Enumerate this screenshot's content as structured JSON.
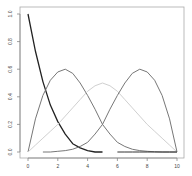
{
  "chart_data": {
    "type": "line",
    "title": "",
    "xlabel": "",
    "ylabel": "",
    "xlim": [
      0,
      10
    ],
    "ylim": [
      0,
      1
    ],
    "grid": false,
    "legend": null,
    "x_ticks": [
      "0",
      "2",
      "4",
      "6",
      "8",
      "10"
    ],
    "y_ticks": [
      "0.0",
      "0.2",
      "0.4",
      "0.6",
      "0.8",
      "1.0"
    ],
    "x": [
      0,
      0.5,
      1,
      1.5,
      2,
      2.5,
      3,
      3.5,
      4,
      4.5,
      5,
      5.5,
      6,
      6.5,
      7,
      7.5,
      8,
      8.5,
      9,
      9.5,
      10
    ],
    "series": [
      {
        "name": "basis-1",
        "color": "#222222",
        "values": [
          1.0,
          0.73,
          0.51,
          0.34,
          0.22,
          0.13,
          0.06,
          0.03,
          0.01,
          0.0,
          0.0,
          null,
          null,
          null,
          null,
          null,
          null,
          null,
          null,
          null,
          null
        ]
      },
      {
        "name": "basis-2",
        "color": "#777777",
        "values": [
          0.0,
          0.24,
          0.41,
          0.52,
          0.58,
          0.6,
          0.57,
          0.5,
          0.41,
          0.31,
          0.2,
          0.13,
          0.07,
          0.04,
          0.02,
          0.01,
          0.005,
          0.002,
          0.0,
          0.0,
          0.0
        ]
      },
      {
        "name": "basis-3",
        "color": "#d0d0d0",
        "values": [
          0.0,
          0.05,
          0.1,
          0.15,
          0.2,
          0.26,
          0.32,
          0.38,
          0.44,
          0.48,
          0.5,
          0.48,
          0.44,
          0.38,
          0.32,
          0.26,
          0.2,
          0.15,
          0.1,
          0.05,
          0.0
        ]
      },
      {
        "name": "basis-4",
        "color": "#777777",
        "values": [
          null,
          null,
          0.0,
          0.0,
          0.005,
          0.01,
          0.02,
          0.04,
          0.07,
          0.13,
          0.2,
          0.31,
          0.41,
          0.5,
          0.57,
          0.6,
          0.58,
          0.52,
          0.41,
          0.24,
          0.0
        ]
      },
      {
        "name": "basis-5",
        "color": "#333333",
        "values": [
          null,
          null,
          null,
          null,
          null,
          null,
          null,
          null,
          null,
          null,
          null,
          null,
          0.0,
          0.0,
          0.0,
          0.0,
          0.0,
          0.0,
          0.0,
          0.0,
          0.0
        ]
      }
    ]
  }
}
